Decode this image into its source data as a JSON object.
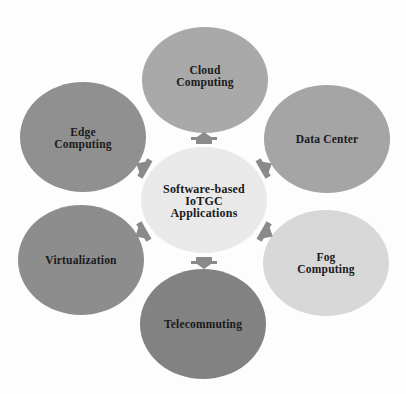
{
  "diagram": {
    "type": "hub-and-spoke",
    "center": {
      "label": "Software-based\nIoTGC\nApplications",
      "color": "#ebebeb"
    },
    "nodes": [
      {
        "id": "cloud",
        "label": "Cloud\nComputing",
        "color": "#a8a8a8",
        "position": "top"
      },
      {
        "id": "datacenter",
        "label": "Data Center",
        "color": "#a4a4a4",
        "position": "upper-right"
      },
      {
        "id": "fog",
        "label": "Fog\nComputing",
        "color": "#d9d9d9",
        "position": "lower-right"
      },
      {
        "id": "telecommuting",
        "label": "Telecommuting",
        "color": "#808080",
        "position": "bottom"
      },
      {
        "id": "virtualization",
        "label": "Virtualization",
        "color": "#8b8b8b",
        "position": "lower-left"
      },
      {
        "id": "edge",
        "label": "Edge\nComputing",
        "color": "#8e8e8e",
        "position": "upper-left"
      }
    ],
    "arrow_color": "#8a8a8a",
    "arrow_direction": "outward from center"
  }
}
